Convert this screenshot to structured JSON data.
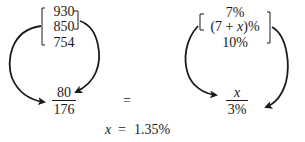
{
  "left_column": {
    "values": [
      "930",
      "850",
      "754"
    ],
    "fraction": {
      "numerator": "80",
      "denominator": "176"
    }
  },
  "right_column": {
    "values": [
      "7%",
      "(7 + x)%",
      "10%"
    ],
    "fraction": {
      "numerator": "x",
      "denominator": "3%"
    }
  },
  "equals_sign": "=",
  "result": {
    "lhs": "x",
    "op": "=",
    "rhs": "1.35%"
  },
  "colors": {
    "ink": "#1a1a1a",
    "background": "#ffffff"
  }
}
